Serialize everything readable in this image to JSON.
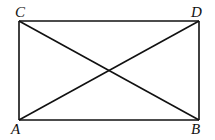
{
  "diagram": {
    "type": "rectangle-with-diagonals",
    "vertices": [
      {
        "label": "C",
        "x": 19,
        "y": 21
      },
      {
        "label": "D",
        "x": 199,
        "y": 21
      },
      {
        "label": "A",
        "x": 19,
        "y": 120
      },
      {
        "label": "B",
        "x": 199,
        "y": 120
      }
    ],
    "labels": {
      "C": "C",
      "D": "D",
      "A": "A",
      "B": "B"
    },
    "edges": [
      "CD",
      "DB",
      "BA",
      "AC"
    ],
    "diagonals": [
      "CB",
      "AD"
    ],
    "stroke_color": "#111111"
  }
}
